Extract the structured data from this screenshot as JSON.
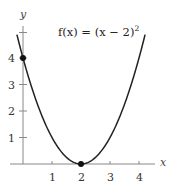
{
  "chart_data": {
    "type": "line",
    "title_parts": {
      "main": "f(x) = (x − 2)",
      "sup": "2"
    },
    "xlabel": "x",
    "ylabel": "y",
    "x_ticks": [
      "1",
      "2",
      "3",
      "4"
    ],
    "y_ticks": [
      "1",
      "2",
      "3",
      "4"
    ],
    "xlim": [
      0,
      4.4
    ],
    "ylim": [
      0,
      5
    ],
    "grid": false,
    "legend": "none",
    "series": [
      {
        "name": "f(x) = (x - 2)^2",
        "function": "(x-2)^2",
        "x": [
          -0.2,
          0,
          0.5,
          1,
          1.5,
          2,
          2.5,
          3,
          3.5,
          4,
          4.2
        ],
        "values": [
          4.84,
          4,
          2.25,
          1,
          0.25,
          0,
          0.25,
          1,
          2.25,
          4,
          4.84
        ]
      }
    ],
    "points": [
      {
        "x": 0,
        "y": 4,
        "label": "y-intercept"
      },
      {
        "x": 2,
        "y": 0,
        "label": "vertex"
      }
    ]
  }
}
